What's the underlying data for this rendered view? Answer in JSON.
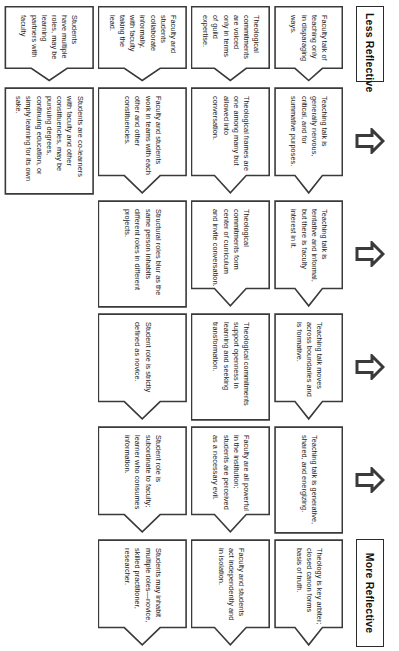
{
  "diagram": {
    "scale": {
      "low_label": "Less Reflective",
      "high_label": "More Reflective",
      "direction_icon": "up-arrow-icon",
      "arrow_count": 5
    },
    "stage_count": 5,
    "rows": [
      {
        "name": "teaching-talk",
        "cells": [
          "Faculty talk of teaching only in disparaging ways.",
          "Teaching talk is generally nervous, critical, and for summative purposes.",
          "Teaching talk is tentative and informal, but there is faculty interest in it.",
          "Teaching talk moves across boundaries and is formative.",
          "Teaching talk is generative, shared, and energizing."
        ]
      },
      {
        "name": "theological-commitments",
        "cells": [
          "Theology is key arbiter; closed canon forms basis of truth.",
          "Theological commitments are voiced only in terms of guild expertise.",
          "Theological frames are one among many but allowed into conversation.",
          "Theological commitments form center of curriculum and invite conversation.",
          "Theological commitments support openness in learning and seeking transformation."
        ]
      },
      {
        "name": "faculty-roles",
        "cells": [
          "Faculty are all powerful in the institution; students are perceived as a necessary evil.",
          "Faculty and students act independently and in isolation.",
          "Faculty and students collaborate informally, with faculty taking the lead.",
          "Faculty and students work in teams with each other and other constituencies.",
          "Structural roles blur as the same person inhabits different roles in different projects."
        ]
      },
      {
        "name": "student-roles",
        "cells": [
          "Student role is strictly defined as novice.",
          "Student role is subordinate to faculty; learner who consumes information.",
          "Students may inhabit multiple roles—novice, skilled practitioner, researcher.",
          "Students have multiple roles, may be learning partners with faculty",
          "Students are co-learners with faculty and other constituencies, may be pursuing degrees, continuing education, or simply learning for its own sake."
        ]
      }
    ]
  }
}
